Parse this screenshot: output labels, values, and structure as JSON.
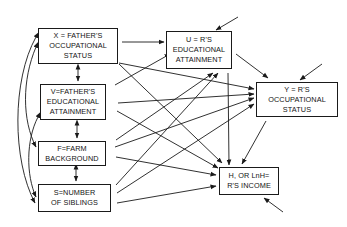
{
  "diagram": {
    "type": "path-diagram",
    "nodes": {
      "X": {
        "lines": [
          "X = FATHER'S",
          "OCCUPATIONAL",
          "STATUS"
        ]
      },
      "V": {
        "lines": [
          "V=FATHER'S",
          "EDUCATIONAL",
          "ATTAINMENT"
        ]
      },
      "F": {
        "lines": [
          "F=FARM",
          "BACKGROUND"
        ]
      },
      "S": {
        "lines": [
          "S=NUMBER",
          "OF SIBLINGS"
        ]
      },
      "U": {
        "lines": [
          "U = R'S",
          "EDUCATIONAL",
          "ATTAINMENT"
        ]
      },
      "Y": {
        "lines": [
          "Y = R'S",
          "OCCUPATIONAL",
          "STATUS"
        ]
      },
      "H": {
        "lines": [
          "H, OR LnH=",
          "R'S INCOME"
        ]
      }
    },
    "edges": [
      {
        "from": "X",
        "to": "U"
      },
      {
        "from": "X",
        "to": "Y"
      },
      {
        "from": "X",
        "to": "H"
      },
      {
        "from": "V",
        "to": "U"
      },
      {
        "from": "V",
        "to": "Y"
      },
      {
        "from": "V",
        "to": "H"
      },
      {
        "from": "F",
        "to": "U"
      },
      {
        "from": "F",
        "to": "Y"
      },
      {
        "from": "F",
        "to": "H"
      },
      {
        "from": "S",
        "to": "U"
      },
      {
        "from": "S",
        "to": "Y"
      },
      {
        "from": "S",
        "to": "H"
      },
      {
        "from": "U",
        "to": "Y"
      },
      {
        "from": "U",
        "to": "H"
      },
      {
        "from": "Y",
        "to": "H"
      }
    ],
    "correlations": [
      [
        "X",
        "V"
      ],
      [
        "V",
        "F"
      ],
      [
        "F",
        "S"
      ],
      [
        "X",
        "F"
      ],
      [
        "X",
        "S"
      ],
      [
        "V",
        "S"
      ]
    ],
    "disturbances": [
      "U",
      "Y",
      "H"
    ]
  }
}
